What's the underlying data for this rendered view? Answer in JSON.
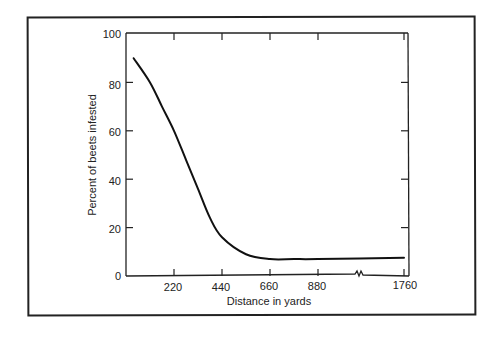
{
  "chart_data": {
    "type": "line",
    "title": "",
    "xlabel": "Distance in yards",
    "ylabel": "Percent of beets infested",
    "x_tick_labels": [
      "220",
      "440",
      "660",
      "880",
      "1760"
    ],
    "x_axis_break": "between 880 and 1760",
    "y_tick_labels": [
      "0",
      "20",
      "40",
      "60",
      "80",
      "100"
    ],
    "ylim": [
      0,
      100
    ],
    "grid": false,
    "legend": null,
    "series": [
      {
        "name": "Percent of beets infested",
        "x": [
          35,
          110,
          165,
          220,
          275,
          330,
          385,
          440,
          550,
          660,
          770,
          880,
          1760
        ],
        "values": [
          90,
          80,
          70,
          60,
          48,
          36,
          24,
          16,
          9,
          7,
          7,
          7,
          7.5
        ]
      }
    ]
  },
  "labels": {
    "xlabel": "Distance in yards",
    "ylabel": "Percent of beets infested",
    "x_ticks": [
      "220",
      "440",
      "660",
      "880",
      "1760"
    ],
    "y_ticks": [
      "0",
      "20",
      "40",
      "60",
      "80",
      "100"
    ]
  }
}
